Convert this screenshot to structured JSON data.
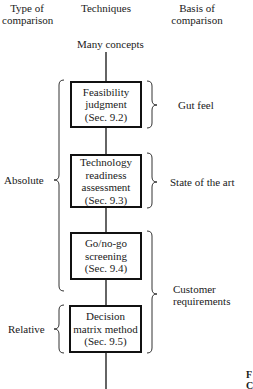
{
  "headers": {
    "type": [
      "Type of",
      "comparison"
    ],
    "techniques": "Techniques",
    "basis": [
      "Basis of",
      "comparison"
    ]
  },
  "start_label": "Many concepts",
  "boxes": [
    {
      "lines": [
        "Feasibility",
        "judgment",
        "(Sec. 9.2)"
      ]
    },
    {
      "lines": [
        "Technology",
        "readiness",
        "assessment",
        "(Sec. 9.3)"
      ]
    },
    {
      "lines": [
        "Go/no-go",
        "screening",
        "(Sec. 9.4)"
      ]
    },
    {
      "lines": [
        "Decision",
        "matrix method",
        "(Sec. 9.5)"
      ]
    }
  ],
  "type_labels": {
    "absolute": "Absolute",
    "relative": "Relative"
  },
  "basis_labels": {
    "gut_feel": "Gut feel",
    "state_of_art": "State of the art",
    "customer": [
      "Customer",
      "requirements"
    ]
  },
  "caption_fragment": [
    "F",
    "C"
  ]
}
